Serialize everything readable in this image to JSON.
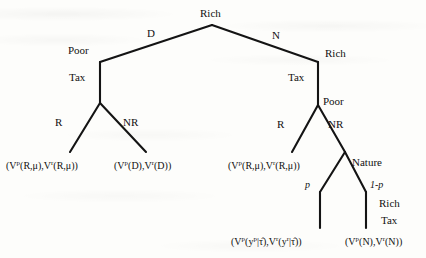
{
  "figure": {
    "type": "extensive-form-game-tree",
    "root": {
      "label": "Rich"
    },
    "nodes": [
      {
        "id": "root",
        "label": "Rich",
        "x": 212,
        "y": 25
      },
      {
        "id": "poor-left",
        "label": "Poor",
        "x": 100,
        "y": 62
      },
      {
        "id": "rich-right",
        "label": "Rich",
        "x": 318,
        "y": 62
      },
      {
        "id": "tax-left",
        "label": "Tax",
        "x": 100,
        "y": 103
      },
      {
        "id": "tax-right",
        "label": "Tax",
        "x": 318,
        "y": 103
      },
      {
        "id": "poor-right",
        "label": "Poor",
        "x": 318,
        "y": 105
      },
      {
        "id": "nature",
        "label": "Nature",
        "x": 345,
        "y": 152
      }
    ],
    "edge_labels": {
      "root_left": "D",
      "root_right": "N",
      "tax_left": "Tax",
      "tax_right": "Tax",
      "left_r": "R",
      "left_nr": "NR",
      "right_r": "R",
      "right_nr": "NR",
      "nature_left": "p",
      "nature_right": "1-p"
    },
    "nature_node_label": "Nature",
    "bottom_right_labels": [
      "Rich",
      "Tax"
    ],
    "payoffs": [
      {
        "id": "payoff-left-r",
        "parts": [
          "(V",
          "p",
          "(R,μ),V",
          "r",
          "(R,μ))"
        ]
      },
      {
        "id": "payoff-left-nr",
        "parts": [
          "(V",
          "p",
          "(D),V",
          "r",
          "(D))"
        ]
      },
      {
        "id": "payoff-right-r",
        "parts": [
          "(V",
          "p",
          "(R,μ),V",
          "r",
          "(R,μ))"
        ]
      },
      {
        "id": "payoff-nature-p",
        "parts": [
          "(V",
          "p",
          "(y",
          "p",
          "|τ̂),V",
          "r",
          "(y",
          "r",
          "|τ̂))"
        ]
      },
      {
        "id": "payoff-nature-1p",
        "parts": [
          "(V",
          "p",
          "(N),V",
          "r",
          "(N))"
        ]
      }
    ],
    "payoff_text": {
      "left_r": "(V^p(R,μ),V^r(R,μ))",
      "left_nr": "(V^p(D),V^r(D))",
      "right_r": "(V^p(R,μ),V^r(R,μ))",
      "nature_p": "(V^p(y^p|τ̂),V^r(y^r|τ̂))",
      "nature_1p": "(V^p(N),V^r(N))"
    },
    "colors": {
      "ink": "#111111",
      "page": "#fdfdfb"
    }
  }
}
